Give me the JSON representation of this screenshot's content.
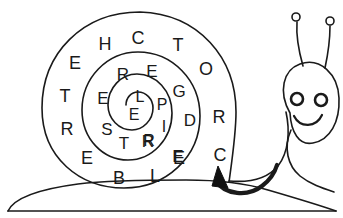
{
  "image": {
    "title": "Snail with lettered spiral shell",
    "description": "Line-art drawing of a smiling snail whose shell is a spiral maze filled with capital letters, with a filled arrow marker at the shell opening indicating the reading direction.",
    "style": "black-and-white line drawing",
    "stroke_color": "#1a1a1a",
    "background_color": "#ffffff",
    "width": 343,
    "height": 218
  },
  "shell": {
    "name": "spiral-shell",
    "rings": [
      {
        "name": "outer-ring",
        "letters": [
          "E",
          "H",
          "C",
          "T",
          "O",
          "R",
          "C",
          "E",
          "L",
          "B",
          "E",
          "R",
          "T",
          "E"
        ]
      },
      {
        "name": "middle-ring",
        "letters": [
          "R",
          "E",
          "G",
          "D",
          "E",
          "R",
          "T",
          "S",
          "E"
        ]
      },
      {
        "name": "inner-ring",
        "letters": [
          "L",
          "P",
          "I",
          "R",
          "E"
        ]
      },
      {
        "name": "core",
        "letters": [
          "E"
        ]
      }
    ],
    "letters_positioned": [
      {
        "char": "E",
        "x": 75,
        "y": 63,
        "size": 18,
        "ring": "outer"
      },
      {
        "char": "H",
        "x": 105,
        "y": 44,
        "size": 18,
        "ring": "outer"
      },
      {
        "char": "C",
        "x": 138,
        "y": 38,
        "size": 18,
        "ring": "outer"
      },
      {
        "char": "T",
        "x": 178,
        "y": 45,
        "size": 18,
        "ring": "outer"
      },
      {
        "char": "O",
        "x": 206,
        "y": 69,
        "size": 18,
        "ring": "outer"
      },
      {
        "char": "R",
        "x": 219,
        "y": 117,
        "size": 18,
        "ring": "outer"
      },
      {
        "char": "C",
        "x": 220,
        "y": 155,
        "size": 18,
        "ring": "outer"
      },
      {
        "char": "E",
        "x": 179,
        "y": 158,
        "size": 18,
        "ring": "outer"
      },
      {
        "char": "L",
        "x": 155,
        "y": 176,
        "size": 18,
        "ring": "outer"
      },
      {
        "char": "B",
        "x": 119,
        "y": 178,
        "size": 18,
        "ring": "outer"
      },
      {
        "char": "E",
        "x": 87,
        "y": 158,
        "size": 18,
        "ring": "outer"
      },
      {
        "char": "R",
        "x": 67,
        "y": 129,
        "size": 18,
        "ring": "outer"
      },
      {
        "char": "T",
        "x": 65,
        "y": 96,
        "size": 18,
        "ring": "outer"
      },
      {
        "char": "R",
        "x": 123,
        "y": 74,
        "size": 17,
        "ring": "middle"
      },
      {
        "char": "E",
        "x": 152,
        "y": 71,
        "size": 17,
        "ring": "middle"
      },
      {
        "char": "G",
        "x": 179,
        "y": 91,
        "size": 17,
        "ring": "middle"
      },
      {
        "char": "D",
        "x": 190,
        "y": 120,
        "size": 17,
        "ring": "middle"
      },
      {
        "char": "E",
        "x": 178,
        "y": 156,
        "size": 17,
        "ring": "middle"
      },
      {
        "char": "R",
        "x": 148,
        "y": 141,
        "size": 17,
        "ring": "middle"
      },
      {
        "char": "T",
        "x": 124,
        "y": 143,
        "size": 17,
        "ring": "middle"
      },
      {
        "char": "S",
        "x": 107,
        "y": 129,
        "size": 17,
        "ring": "middle"
      },
      {
        "char": "E",
        "x": 103,
        "y": 98,
        "size": 17,
        "ring": "middle"
      },
      {
        "char": "L",
        "x": 140,
        "y": 97,
        "size": 16,
        "ring": "inner"
      },
      {
        "char": "P",
        "x": 162,
        "y": 105,
        "size": 16,
        "ring": "inner"
      },
      {
        "char": "I",
        "x": 164,
        "y": 127,
        "size": 16,
        "ring": "inner"
      },
      {
        "char": "R",
        "x": 149,
        "y": 141,
        "size": 16,
        "ring": "inner"
      },
      {
        "char": "E",
        "x": 134,
        "y": 115,
        "size": 16,
        "ring": "core"
      }
    ]
  },
  "snail": {
    "name": "snail-character",
    "parts": [
      {
        "name": "shell-outline",
        "label": "Shell outline"
      },
      {
        "name": "body-foot",
        "label": "Body and foot"
      },
      {
        "name": "head",
        "label": "Head"
      },
      {
        "name": "left-eye",
        "label": "Left eye"
      },
      {
        "name": "right-eye",
        "label": "Right eye"
      },
      {
        "name": "smile",
        "label": "Smile"
      },
      {
        "name": "left-antenna",
        "label": "Left antenna"
      },
      {
        "name": "right-antenna",
        "label": "Right antenna"
      },
      {
        "name": "ground-line",
        "label": "Ground line"
      }
    ],
    "expression": "smiling"
  },
  "marker": {
    "name": "direction-arrow",
    "label": "Start arrow at shell opening",
    "shape": "filled triangle on curved tail",
    "fill": "#111111",
    "points": "up-left"
  }
}
